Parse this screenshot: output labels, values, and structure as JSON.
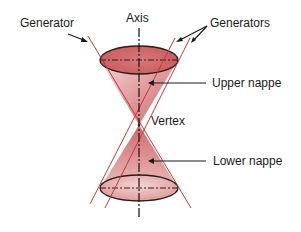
{
  "diagram": {
    "labels": {
      "axis": "Axis",
      "generator": "Generator",
      "generators": "Generators",
      "upper_nappe": "Upper nappe",
      "vertex": "Vertex",
      "lower_nappe": "Lower nappe"
    },
    "colors": {
      "cone_fill": "#d9787a",
      "cone_fill_light": "#f2c9c8",
      "generator_line": "#c0393b",
      "outline": "#2a1a1a",
      "text": "#1a1a1a",
      "background": "#ffffff"
    },
    "geometry": {
      "axis_x": 139,
      "vertex": [
        139,
        125
      ],
      "upper_ellipse": {
        "cx": 139,
        "cy": 60,
        "rx": 39,
        "ry": 14
      },
      "lower_ellipse": {
        "cx": 139,
        "cy": 188,
        "rx": 39,
        "ry": 13
      }
    }
  }
}
